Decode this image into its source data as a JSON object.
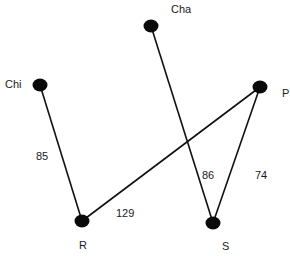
{
  "diagram": {
    "type": "weighted-graph",
    "colors": {
      "node": "#0a0a0a",
      "edge": "#111111",
      "text": "#1a1a1a",
      "background": "#ffffff"
    },
    "nodes": [
      {
        "id": "Chi",
        "label": "Chi",
        "x": 40,
        "y": 85,
        "label_x": 5,
        "label_y": 88
      },
      {
        "id": "Cha",
        "label": "Cha",
        "x": 151,
        "y": 26,
        "label_x": 171,
        "label_y": 13
      },
      {
        "id": "P",
        "label": "P",
        "x": 260,
        "y": 87,
        "label_x": 282,
        "label_y": 97
      },
      {
        "id": "R",
        "label": "R",
        "x": 82,
        "y": 221,
        "label_x": 79,
        "label_y": 249
      },
      {
        "id": "S",
        "label": "S",
        "x": 213,
        "y": 223,
        "label_x": 222,
        "label_y": 250
      }
    ],
    "edges": [
      {
        "from": "Chi",
        "to": "R",
        "weight": "85",
        "label_x": 36,
        "label_y": 160
      },
      {
        "from": "Cha",
        "to": "S",
        "weight": "86",
        "label_x": 202,
        "label_y": 179
      },
      {
        "from": "P",
        "to": "R",
        "weight": "129",
        "label_x": 116,
        "label_y": 217
      },
      {
        "from": "P",
        "to": "S",
        "weight": "74",
        "label_x": 255,
        "label_y": 179
      }
    ]
  }
}
